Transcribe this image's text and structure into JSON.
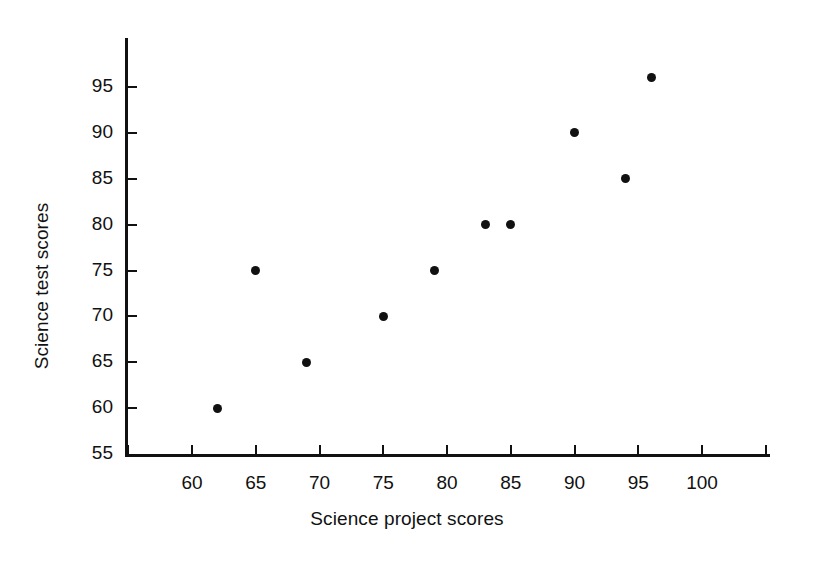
{
  "chart_data": {
    "type": "scatter",
    "title": "",
    "xlabel": "Science project scores",
    "ylabel": "Science test scores",
    "xlim": [
      55,
      105
    ],
    "ylim": [
      55,
      97.5
    ],
    "xticks": [
      60,
      65,
      70,
      75,
      80,
      85,
      90,
      95,
      100
    ],
    "yticks": [
      60,
      65,
      70,
      75,
      80,
      85,
      90,
      95
    ],
    "xtick_labels": [
      "60",
      "65",
      "70",
      "75",
      "80",
      "85",
      "90",
      "95",
      "100"
    ],
    "ytick_labels": [
      "60",
      "65",
      "70",
      "75",
      "80",
      "85",
      "90",
      "95"
    ],
    "y_axis_origin_label": "55",
    "grid": false,
    "legend": false,
    "marker": "filled-circle",
    "marker_color": "#111111",
    "points": [
      {
        "x": 62,
        "y": 60
      },
      {
        "x": 65,
        "y": 75
      },
      {
        "x": 69,
        "y": 65
      },
      {
        "x": 75,
        "y": 70
      },
      {
        "x": 79,
        "y": 75
      },
      {
        "x": 83,
        "y": 80
      },
      {
        "x": 85,
        "y": 80
      },
      {
        "x": 90,
        "y": 90
      },
      {
        "x": 94,
        "y": 85
      },
      {
        "x": 96,
        "y": 96
      }
    ]
  },
  "colors": {
    "background": "#ffffff",
    "axis": "#111111",
    "text": "#111111",
    "marker": "#111111"
  }
}
